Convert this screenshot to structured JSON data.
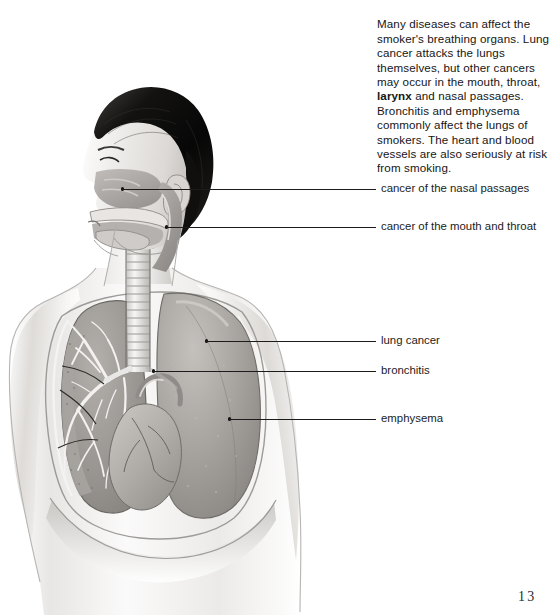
{
  "page": {
    "folio": "13",
    "background_color": "#ffffff",
    "text_color": "#161616",
    "leader_color": "#1b1b1b"
  },
  "intro": {
    "before_bold": "Many diseases can affect the smoker's breathing organs. Lung cancer attacks the lungs themselves, but other cancers may occur in the mouth, throat, ",
    "bold_term": "larynx",
    "after_bold": " and nasal passages. Bronchitis and emphysema commonly affect the lungs of smokers. The heart and blood vessels are also seriously at risk from smoking.",
    "full_text": "Many diseases can affect the smoker's breathing organs. Lung cancer attacks the lungs themselves, but other cancers may occur in the mouth, throat, larynx and nasal passages. Bronchitis and emphysema commonly affect the lungs of smokers. The heart and blood vessels are also seriously at risk from smoking."
  },
  "callouts": [
    {
      "id": "nasal-passages",
      "label": "cancer of the nasal passages",
      "text_x": 381,
      "text_y": 186,
      "line_y": 189,
      "line_x1": 122,
      "line_x2": 376,
      "dot_x": 121,
      "dot_y": 189
    },
    {
      "id": "mouth-throat",
      "label": "cancer of the mouth and throat",
      "text_x": 381,
      "text_y": 224,
      "line_y": 227,
      "line_x1": 166,
      "line_x2": 376,
      "dot_x": 165,
      "dot_y": 227
    },
    {
      "id": "lung-cancer",
      "label": "lung cancer",
      "text_x": 381,
      "text_y": 338,
      "line_y": 341,
      "line_x1": 206,
      "line_x2": 376,
      "dot_x": 205,
      "dot_y": 341
    },
    {
      "id": "bronchitis",
      "label": "bronchitis",
      "text_x": 381,
      "text_y": 368,
      "line_y": 371,
      "line_x1": 153,
      "line_x2": 376,
      "dot_x": 152,
      "dot_y": 371
    },
    {
      "id": "emphysema",
      "label": "emphysema",
      "text_x": 381,
      "text_y": 416,
      "line_y": 419,
      "line_x1": 229,
      "line_x2": 376,
      "dot_x": 228,
      "dot_y": 419
    }
  ],
  "illustration": {
    "description": "Grayscale anatomical illustration: head in left profile with cutaway of nasal cavity, mouth, throat and larynx; chest and torso with cutaway of the left lung showing the bronchial tree, the intact right lung, heart and trachea.",
    "parts": [
      "hair",
      "face-profile",
      "nasal-cavity",
      "oral-cavity",
      "tongue",
      "pharynx",
      "larynx",
      "trachea",
      "left-lung-cutaway",
      "bronchial-tree",
      "right-lung",
      "heart",
      "ribcage",
      "diaphragm",
      "shoulder-left",
      "shoulder-right"
    ],
    "colors": {
      "hair": "#0b0b0b",
      "skin_light": "#f2f0ef",
      "skin_mid": "#d3d0cd",
      "skin_shadow": "#a9a6a3",
      "lung_tissue": "#9d9a97",
      "lung_cut": "#8d8a86",
      "bronchi": "#efeeec",
      "heart": "#b6b2ae",
      "outline": "#5c5a58"
    }
  }
}
